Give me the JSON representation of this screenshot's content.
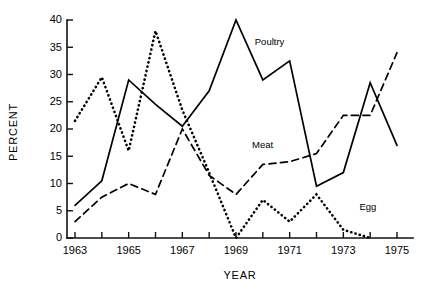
{
  "chart_data": {
    "type": "line",
    "title": "",
    "xlabel": "YEAR",
    "ylabel": "PERCENT",
    "xlim": [
      1963,
      1975.6
    ],
    "ylim": [
      0,
      40
    ],
    "yticks": [
      0,
      5,
      10,
      15,
      20,
      25,
      30,
      35,
      40
    ],
    "ytick_labels": [
      "0",
      "5",
      "10",
      "15",
      "20",
      "25",
      "30",
      "35",
      "40"
    ],
    "xticks": [
      1963,
      1964,
      1965,
      1966,
      1967,
      1968,
      1969,
      1970,
      1971,
      1972,
      1973,
      1974,
      1975
    ],
    "xtick_labels": [
      "1963",
      "",
      "1965",
      "",
      "1967",
      "",
      "1969",
      "",
      "1971",
      "",
      "1973",
      "",
      "1975"
    ],
    "grid": false,
    "legend_position": "inline-annotations",
    "x": [
      1963,
      1964,
      1965,
      1966,
      1967,
      1968,
      1969,
      1970,
      1971,
      1972,
      1973,
      1974,
      1975
    ],
    "series": [
      {
        "name": "Poultry",
        "style": "solid",
        "color": "#000000",
        "values": [
          6,
          10.5,
          29,
          24.5,
          20.5,
          27,
          40,
          29,
          32.5,
          9.5,
          12,
          28.5,
          17
        ],
        "label_x": 1969.7,
        "label_y": 35.5
      },
      {
        "name": "Meat",
        "style": "dashed",
        "color": "#000000",
        "values": [
          3,
          7.5,
          10,
          8,
          20,
          11.5,
          8,
          13.5,
          14,
          15.5,
          22.5,
          22.5,
          34
        ],
        "label_x": 1969.6,
        "label_y": 16.5
      },
      {
        "name": "Egg",
        "style": "dotted",
        "color": "#000000",
        "values": [
          21.5,
          29.5,
          16,
          38,
          23.5,
          12,
          0,
          7,
          3,
          8,
          1.5,
          0,
          null
        ],
        "label_x": 1973.6,
        "label_y": 5.2
      }
    ],
    "annotations": [
      {
        "text": "Poultry",
        "x": 1969.7,
        "y": 35.5
      },
      {
        "text": "Meat",
        "x": 1969.6,
        "y": 16.5
      },
      {
        "text": "Egg",
        "x": 1973.6,
        "y": 5.2
      }
    ]
  },
  "axes": {
    "y_title": "PERCENT",
    "x_title": "YEAR"
  }
}
